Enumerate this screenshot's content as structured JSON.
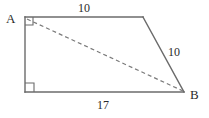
{
  "figure": {
    "width": 209,
    "height": 118,
    "background_color": "#ffffff",
    "stroke_color": "#6b6b6b",
    "diagonal_color": "#7a7a7a",
    "text_color": "#2b2b2b"
  },
  "vertices": {
    "a": {
      "label": "A",
      "x": 25,
      "y": 17
    },
    "top_right": {
      "label": "",
      "x": 143,
      "y": 17
    },
    "b": {
      "label": "B",
      "x": 184,
      "y": 92
    },
    "bottom_left": {
      "label": "",
      "x": 25,
      "y": 92
    }
  },
  "edges": {
    "top": {
      "length_label": "10",
      "from": "a",
      "to": "top_right"
    },
    "right": {
      "length_label": "10",
      "from": "top_right",
      "to": "b"
    },
    "bottom": {
      "length_label": "17",
      "from": "bottom_left",
      "to": "b"
    },
    "left": {
      "length_label": "",
      "from": "a",
      "to": "bottom_left"
    }
  },
  "diagonal": {
    "from": "a",
    "to": "b",
    "style": "dashed",
    "dash_pattern": "4 3"
  },
  "right_angle_markers": [
    {
      "at": "a",
      "size": 8
    },
    {
      "at": "bottom_left",
      "size": 9
    }
  ],
  "labels": {
    "vertex_a": "A",
    "vertex_b": "B",
    "top_length": "10",
    "right_length": "10",
    "bottom_length": "17"
  }
}
